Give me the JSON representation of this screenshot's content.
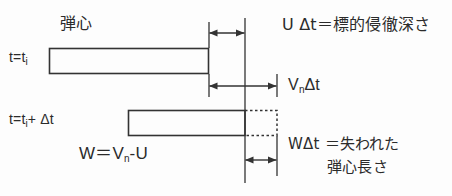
{
  "diagram": {
    "colors": {
      "background": "#fdfdfd",
      "ink": "#2b2b2b",
      "line": "#333333"
    },
    "labels": {
      "core": "弾心",
      "t_initial": "t=t",
      "t_initial_sub": "i",
      "t_delta_prefix": "t=t",
      "t_delta_sub": "i",
      "t_delta_suffix": "+ Δt",
      "u_delta_t": "U Δt＝標的侵徹深さ",
      "vn_delta_t_pre": "V",
      "vn_delta_t_sub": "n",
      "vn_delta_t_post": "Δt",
      "w_equation_pre": "W＝V",
      "w_equation_sub": "n",
      "w_equation_post": "-U",
      "w_delta_t": "WΔt ＝失われた",
      "lost_length": "弾心長さ"
    },
    "shapes": {
      "upper_bar": {
        "name": "penetrator-at-t-initial",
        "x": 49,
        "y": 48,
        "width": 160,
        "height": 26
      },
      "lower_bar_solid": {
        "name": "penetrator-at-t-plus-delta",
        "x": 128,
        "y": 110,
        "width": 117,
        "height": 26
      },
      "lower_bar_dotted": {
        "name": "eroded-penetrator-segment",
        "x": 245,
        "y": 110,
        "width": 32,
        "height": 26
      },
      "reference_line": {
        "name": "target-surface-reference-line",
        "x": 245,
        "y1": 18,
        "y2": 183
      }
    },
    "dimensions": [
      {
        "name": "u-delta-t-dimension",
        "from_x": 209,
        "to_x": 245,
        "y": 33,
        "label_ref": "u_delta_t"
      },
      {
        "name": "vn-delta-t-dimension",
        "from_x": 209,
        "to_x": 277,
        "y": 86,
        "label_ref": "vn_delta_t"
      },
      {
        "name": "w-delta-t-dimension",
        "from_x": 245,
        "to_x": 277,
        "y": 160,
        "label_ref": "w_delta_t"
      }
    ]
  }
}
